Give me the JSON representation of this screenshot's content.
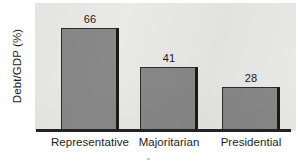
{
  "chart_data": {
    "type": "bar",
    "title": "",
    "subtitle": "",
    "xlabel": "",
    "ylabel": "Debt/GDP (%)",
    "categories": [
      "Representative",
      "Majoritarian",
      "Presidential"
    ],
    "values": [
      66,
      41,
      28
    ],
    "value_labels": [
      "66",
      "41",
      "28"
    ],
    "ylim": [
      0,
      82
    ],
    "grid": false,
    "legend": false,
    "legend_position": "none",
    "orientation": "vertical",
    "y_tick_labels": [],
    "annotations": [],
    "colors": {
      "bar_fill": "#888888",
      "bar_outline": "#2b2b2b",
      "bar_shadow": "#1a1a1a",
      "plot_background": "#e9e9e7",
      "axis_line": "#232323",
      "text": "#1d1d1d",
      "figure_background": "#ffffff"
    }
  }
}
